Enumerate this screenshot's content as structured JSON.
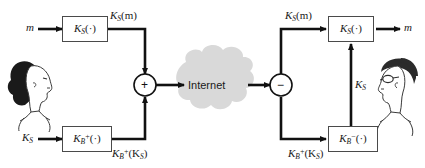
{
  "diagram": {
    "background_color": "#ffffff",
    "line_color": "#111111",
    "box_border_color": "#4a4a4a",
    "cloud_color": "#d9d9d9",
    "network": {
      "label": "Internet"
    },
    "operators": {
      "combine": "+",
      "separate": "−"
    },
    "sender": {
      "name": "alice",
      "description": "woman head profile facing right"
    },
    "receiver": {
      "name": "bob",
      "description": "man head profile with glasses facing left"
    },
    "boxes": [
      {
        "id": "sender-session-encrypt",
        "base": "K",
        "sub": "S",
        "sup": "",
        "arg": "(·)"
      },
      {
        "id": "sender-pubkey-encrypt",
        "base": "K",
        "sub": "B",
        "sup": "+",
        "arg": "(·)"
      },
      {
        "id": "receiver-session-decrypt",
        "base": "K",
        "sub": "S",
        "sup": "",
        "arg": "(·)"
      },
      {
        "id": "receiver-privkey-decrypt",
        "base": "K",
        "sub": "B",
        "sup": "−",
        "arg": "(·)"
      }
    ],
    "labels": [
      {
        "id": "input-message",
        "base": "m",
        "sub": "",
        "sup": "",
        "arg": ""
      },
      {
        "id": "input-session-key",
        "base": "K",
        "sub": "S",
        "sup": "",
        "arg": ""
      },
      {
        "id": "sender-ciphertext",
        "base": "K",
        "sub": "S",
        "sup": "",
        "arg": "(m)"
      },
      {
        "id": "sender-encrypted-key",
        "base": "K",
        "sub": "B",
        "sup": "+",
        "arg": "(K",
        "arg_sub": "S",
        "arg_tail": ")"
      },
      {
        "id": "receiver-ciphertext",
        "base": "K",
        "sub": "S",
        "sup": "",
        "arg": "(m)"
      },
      {
        "id": "receiver-encrypted-key",
        "base": "K",
        "sub": "B",
        "sup": "+",
        "arg": "(K",
        "arg_sub": "S",
        "arg_tail": ")"
      },
      {
        "id": "recovered-session-key",
        "base": "K",
        "sub": "S",
        "sup": "",
        "arg": ""
      },
      {
        "id": "output-message",
        "base": "m",
        "sub": "",
        "sup": "",
        "arg": ""
      }
    ]
  }
}
